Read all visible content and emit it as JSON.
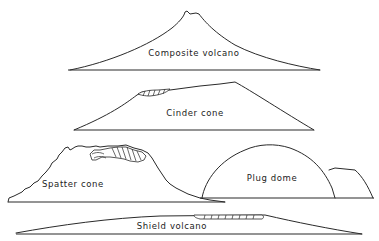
{
  "figure": {
    "type": "volcano-profile-comparison",
    "colors": {
      "line": "#2a2a2a",
      "background": "#ffffff"
    },
    "volcanoes": [
      {
        "id": "composite",
        "label": "Composite volcano"
      },
      {
        "id": "cinder",
        "label": "Cinder cone"
      },
      {
        "id": "spatter",
        "label": "Spatter cone"
      },
      {
        "id": "plug",
        "label": "Plug dome"
      },
      {
        "id": "shield",
        "label": "Shield volcano"
      }
    ]
  }
}
